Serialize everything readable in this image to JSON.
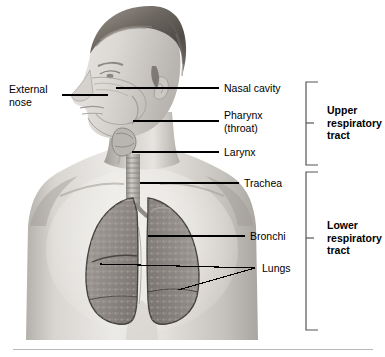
{
  "labels": {
    "external_nose": "External\nnose",
    "nasal_cavity": "Nasal cavity",
    "pharynx": "Pharynx\n(throat)",
    "larynx": "Larynx",
    "trachea": "Trachea",
    "bronchi": "Bronchi",
    "lungs": "Lungs"
  },
  "brackets": {
    "upper": "Upper\nrespiratory\ntract",
    "lower": "Lower\nrespiratory\ntract"
  },
  "colors": {
    "background": "#ffffff",
    "text": "#000000",
    "leader_line": "#000000",
    "bracket": "#555555",
    "rule": "#b9b9b9",
    "skin_light": "#e8e6e3",
    "skin_mid": "#c3c0bc",
    "skin_shadow": "#8e8b88",
    "hair_dark": "#5a5550",
    "hair_mid": "#8a837c",
    "lung_fill": "#9b9691",
    "lung_outline": "#4a4642",
    "airway": "#b5b1ac"
  }
}
